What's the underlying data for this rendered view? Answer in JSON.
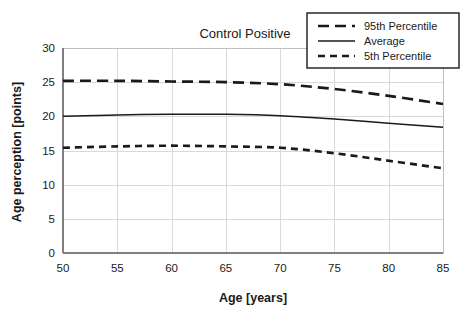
{
  "chart_data": {
    "type": "line",
    "title": "Control Positive",
    "xlabel": "Age [years]",
    "ylabel": "Age perception [points]",
    "xlim": [
      50,
      85
    ],
    "ylim": [
      0,
      30
    ],
    "xticks": [
      50,
      55,
      60,
      65,
      70,
      75,
      80,
      85
    ],
    "yticks": [
      0,
      5,
      10,
      15,
      20,
      25,
      30
    ],
    "grid": true,
    "legend_position": "top-right",
    "x": [
      50,
      55,
      60,
      65,
      70,
      75,
      80,
      85
    ],
    "series": [
      {
        "name": "95th Percentile",
        "style": "dashed-long",
        "color": "#1a1a1a",
        "values": [
          25.2,
          25.2,
          25.1,
          25.0,
          24.7,
          24.0,
          23.0,
          21.8
        ]
      },
      {
        "name": "Average",
        "style": "solid",
        "color": "#1a1a1a",
        "values": [
          20.0,
          20.2,
          20.3,
          20.3,
          20.1,
          19.6,
          19.0,
          18.4
        ]
      },
      {
        "name": "5th Percentile",
        "style": "dashed-short",
        "color": "#1a1a1a",
        "values": [
          15.4,
          15.6,
          15.7,
          15.6,
          15.4,
          14.6,
          13.5,
          12.4
        ]
      }
    ]
  },
  "legend": {
    "items": [
      {
        "label": "95th Percentile",
        "style": "dashed-long"
      },
      {
        "label": "Average",
        "style": "solid"
      },
      {
        "label": "5th Percentile",
        "style": "dashed-short"
      }
    ]
  },
  "axis": {
    "x_tick_labels": [
      "50",
      "55",
      "60",
      "65",
      "70",
      "75",
      "80",
      "85"
    ],
    "y_tick_labels": [
      "0",
      "5",
      "10",
      "15",
      "20",
      "25",
      "30"
    ]
  },
  "colors": {
    "line": "#1a1a1a",
    "grid": "#d9d9d9",
    "border": "#bfbfbf",
    "background": "#ffffff"
  }
}
